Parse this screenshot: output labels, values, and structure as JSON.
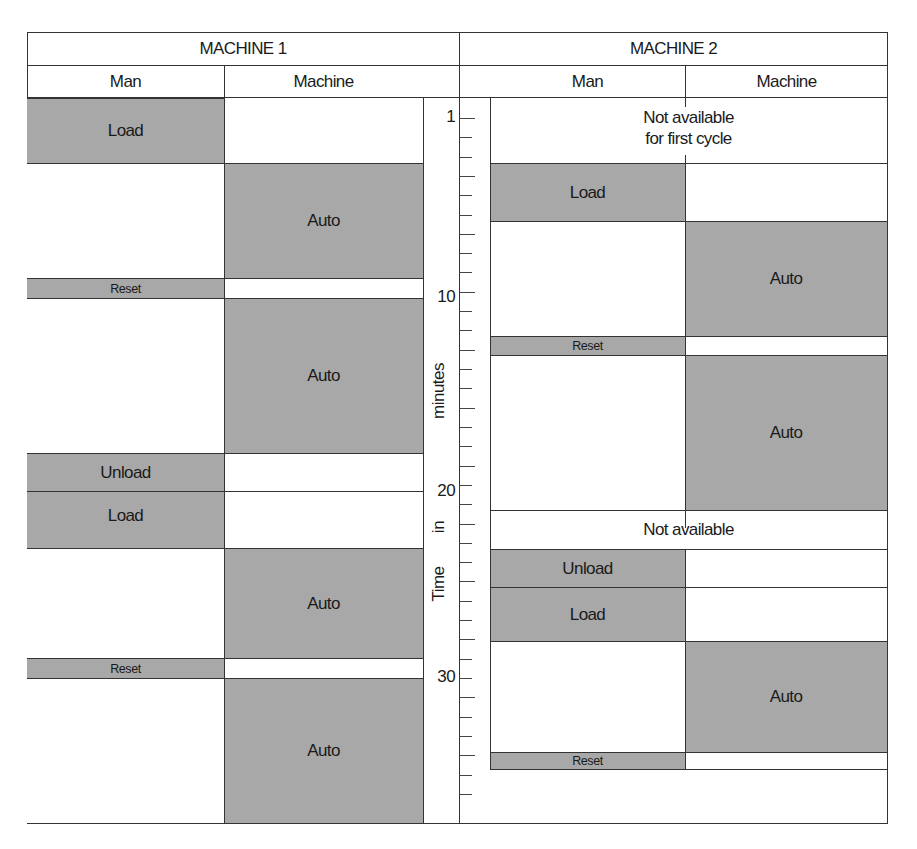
{
  "chart": {
    "machine1": {
      "title": "MACHINE 1",
      "columns": [
        "Man",
        "Machine"
      ],
      "man": [
        {
          "label": "Load",
          "start": 0,
          "end": 3.4,
          "shaded": true
        },
        {
          "label": "",
          "start": 3.4,
          "end": 9.4,
          "shaded": false
        },
        {
          "label": "Reset",
          "start": 9.4,
          "end": 10.4,
          "shaded": true
        },
        {
          "label": "",
          "start": 10.4,
          "end": 18.4,
          "shaded": false
        },
        {
          "label": "Unload",
          "start": 18.4,
          "end": 20.4,
          "shaded": true
        },
        {
          "label": "Load",
          "start": 20.4,
          "end": 23.4,
          "shaded": true
        },
        {
          "label": "",
          "start": 23.4,
          "end": 29.1,
          "shaded": false
        },
        {
          "label": "Reset",
          "start": 29.1,
          "end": 30.1,
          "shaded": true
        },
        {
          "label": "",
          "start": 30.1,
          "end": 37.6,
          "shaded": false
        }
      ],
      "machine": [
        {
          "label": "",
          "start": 0,
          "end": 3.4,
          "shaded": false
        },
        {
          "label": "Auto",
          "start": 3.4,
          "end": 9.4,
          "shaded": true
        },
        {
          "label": "",
          "start": 9.4,
          "end": 10.4,
          "shaded": false
        },
        {
          "label": "Auto",
          "start": 10.4,
          "end": 18.4,
          "shaded": true
        },
        {
          "label": "",
          "start": 18.4,
          "end": 20.4,
          "shaded": false
        },
        {
          "label": "",
          "start": 20.4,
          "end": 23.4,
          "shaded": false
        },
        {
          "label": "Auto",
          "start": 23.4,
          "end": 29.1,
          "shaded": true
        },
        {
          "label": "",
          "start": 29.1,
          "end": 30.1,
          "shaded": false
        },
        {
          "label": "Auto",
          "start": 30.1,
          "end": 37.6,
          "shaded": true
        }
      ]
    },
    "machine2": {
      "title": "MACHINE 2",
      "columns": [
        "Man",
        "Machine"
      ],
      "not_available_1": "Not available\nfor first cycle",
      "not_available_1_line1": "Not available",
      "not_available_1_line2": "for first cycle",
      "not_available_2": "Not available",
      "man": [
        {
          "label": "Load",
          "start": 3.4,
          "end": 6.4,
          "shaded": true
        },
        {
          "label": "",
          "start": 6.4,
          "end": 12.4,
          "shaded": false
        },
        {
          "label": "Reset",
          "start": 12.4,
          "end": 13.4,
          "shaded": true
        },
        {
          "label": "",
          "start": 13.4,
          "end": 21.4,
          "shaded": false
        },
        {
          "label": "Unload",
          "start": 23.4,
          "end": 25.4,
          "shaded": true
        },
        {
          "label": "Load",
          "start": 25.4,
          "end": 28.2,
          "shaded": true
        },
        {
          "label": "",
          "start": 28.2,
          "end": 34,
          "shaded": false
        },
        {
          "label": "Reset",
          "start": 34,
          "end": 35,
          "shaded": true
        }
      ],
      "machine": [
        {
          "label": "",
          "start": 3.4,
          "end": 6.4,
          "shaded": false
        },
        {
          "label": "Auto",
          "start": 6.4,
          "end": 12.4,
          "shaded": true
        },
        {
          "label": "",
          "start": 12.4,
          "end": 13.4,
          "shaded": false
        },
        {
          "label": "Auto",
          "start": 13.4,
          "end": 21.4,
          "shaded": true
        },
        {
          "label": "",
          "start": 23.4,
          "end": 25.4,
          "shaded": false
        },
        {
          "label": "",
          "start": 25.4,
          "end": 28.2,
          "shaded": false
        },
        {
          "label": "Auto",
          "start": 28.2,
          "end": 34,
          "shaded": true
        },
        {
          "label": "",
          "start": 34,
          "end": 35,
          "shaded": false
        }
      ]
    },
    "time_axis": {
      "title_words": [
        "Time",
        "in",
        "minutes"
      ],
      "title": "Time in minutes",
      "labels": [
        "1",
        "10",
        "20",
        "30"
      ],
      "tick_interval_min": 1,
      "range": [
        0,
        37
      ]
    },
    "colors": {
      "shaded": "#a8a8a8",
      "line": "#333333",
      "background": "#ffffff"
    }
  }
}
